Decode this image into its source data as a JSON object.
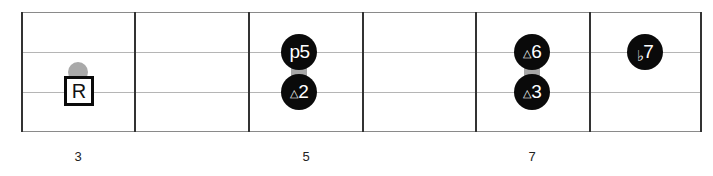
{
  "diagram": {
    "type": "fretboard",
    "strings": 4,
    "frets_shown": 6,
    "colors": {
      "marker_fill": "#0a0a0a",
      "marker_text": "#ffffff",
      "ghost_note": "#a9a9a9",
      "root_border": "#0a0a0a",
      "fret_line": "#333333",
      "string_line": "#b5b5b5"
    },
    "root": {
      "label": "R",
      "fret": 3,
      "string": 3
    },
    "ghost_notes": [
      {
        "fret": 3,
        "string": 2,
        "shape": "semicircle"
      }
    ],
    "markers": [
      {
        "prefix": "",
        "degree": "p5",
        "fret": 5,
        "string": 2
      },
      {
        "prefix": "△",
        "degree": "2",
        "fret": 5,
        "string": 3
      },
      {
        "prefix": "△",
        "degree": "6",
        "fret": 7,
        "string": 2
      },
      {
        "prefix": "△",
        "degree": "3",
        "fret": 7,
        "string": 3
      },
      {
        "prefix": "♭",
        "degree": "7",
        "fret": 8,
        "string": 2
      }
    ],
    "fret_numbers": [
      "3",
      "5",
      "7"
    ]
  }
}
